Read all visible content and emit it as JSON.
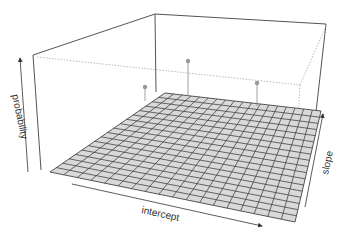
{
  "chart_data": {
    "type": "surface3d",
    "title": "",
    "xlabel": "intercept",
    "ylabel": "slope",
    "zlabel": "probability",
    "grid": {
      "rows": 18,
      "cols": 18,
      "fill": "#d9d9d9",
      "line": "#444444"
    },
    "box": {
      "edge_color": "#555555",
      "dotted_color": "#999999"
    },
    "points": [
      {
        "label": "point-1",
        "screen_x": 145,
        "screen_y": 87,
        "stem_bottom_y": 101
      },
      {
        "label": "point-2",
        "screen_x": 188,
        "screen_y": 61,
        "stem_bottom_y": 96
      },
      {
        "label": "point-3",
        "screen_x": 257,
        "screen_y": 83,
        "stem_bottom_y": 106
      }
    ],
    "point_color": "#999999",
    "surface": "flat near zero probability"
  },
  "labels": {
    "x": "intercept",
    "y": "slope",
    "z": "probability"
  }
}
